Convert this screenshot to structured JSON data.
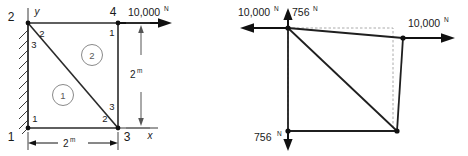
{
  "figure": {
    "colors": {
      "line": "#1a1a1a",
      "mesh": "#3a3a3a",
      "element_circle": "#808080",
      "dashed_original": "#999999",
      "background": "#ffffff",
      "text": "#1a1a1a"
    }
  },
  "left_diagram": {
    "name": "undeformed-mesh",
    "global_nodes": [
      {
        "id": "1",
        "label": "1",
        "position": "bottom-left"
      },
      {
        "id": "2",
        "label": "2",
        "position": "top-left"
      },
      {
        "id": "3",
        "label": "3",
        "position": "bottom-right"
      },
      {
        "id": "4",
        "label": "4",
        "position": "top-right"
      }
    ],
    "local_nodes": [
      {
        "label": "2",
        "owner": "element-2",
        "corner": "top-left"
      },
      {
        "label": "3",
        "owner": "element-1",
        "corner": "top-left"
      },
      {
        "label": "1",
        "owner": "element-2",
        "corner": "top-right"
      },
      {
        "label": "1",
        "owner": "element-1",
        "corner": "bottom-left"
      },
      {
        "label": "2",
        "owner": "element-1",
        "corner": "bottom-right"
      },
      {
        "label": "3",
        "owner": "element-2",
        "corner": "bottom-right"
      }
    ],
    "elements": [
      {
        "id": "1",
        "label": "1"
      },
      {
        "id": "2",
        "label": "2"
      }
    ],
    "axes": {
      "x_label": "x",
      "y_label": "y"
    },
    "dimensions": [
      {
        "name": "width",
        "value": "2",
        "unit": "m"
      },
      {
        "name": "height",
        "value": "2",
        "unit": "m"
      }
    ],
    "load": {
      "value": "10,000",
      "unit": "N",
      "direction": "right"
    },
    "support": "fixed-wall-left"
  },
  "right_diagram": {
    "name": "deformed-shape",
    "forces": [
      {
        "id": "top-left-horizontal",
        "value": "10,000",
        "unit": "N",
        "direction": "left"
      },
      {
        "id": "top-left-vertical",
        "value": "756",
        "unit": "N",
        "direction": "up"
      },
      {
        "id": "bottom-left-vertical",
        "value": "756",
        "unit": "N",
        "direction": "down"
      },
      {
        "id": "top-right-horizontal",
        "value": "10,000",
        "unit": "N",
        "direction": "right"
      }
    ],
    "original_outline": "dashed",
    "deformed_outline": "solid"
  }
}
